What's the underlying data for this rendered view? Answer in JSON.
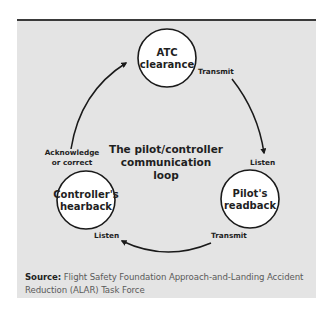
{
  "diagram": {
    "title_lines": [
      "The pilot/controller",
      "communication",
      "loop"
    ],
    "nodes": [
      {
        "id": "atc",
        "lines": [
          "ATC",
          "clearance"
        ]
      },
      {
        "id": "pilot",
        "lines": [
          "Pilot's",
          "readback"
        ]
      },
      {
        "id": "controller",
        "lines": [
          "Controller's",
          "hearback"
        ]
      }
    ],
    "edge_labels": {
      "atc_transmit": "Transmit",
      "pilot_listen": "Listen",
      "pilot_transmit": "Transmit",
      "controller_listen": "Listen",
      "ack_line1": "Acknowledge",
      "ack_line2": "or correct"
    },
    "colors": {
      "panel": "#e4e4e4",
      "rule": "#3a3a3a",
      "stroke": "#1a1a1a",
      "node_fill": "#ffffff"
    }
  },
  "source": {
    "label": "Source:",
    "text": " Flight Safety Foundation Approach-and-Landing Accident Reduction (ALAR) Task Force"
  }
}
